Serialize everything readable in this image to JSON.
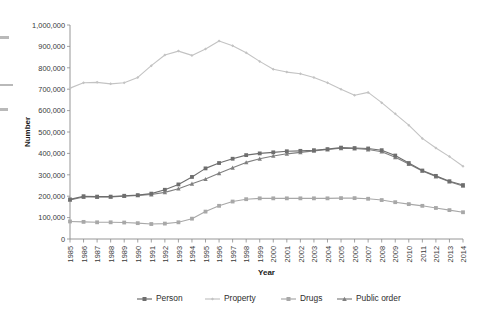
{
  "chart_data": {
    "type": "line",
    "title": "",
    "xlabel": "Year",
    "ylabel": "Number",
    "ylim": [
      0,
      1000000
    ],
    "ytick_labels": [
      "0",
      "100,000",
      "200,000",
      "300,000",
      "400,000",
      "500,000",
      "600,000",
      "700,000",
      "800,000",
      "900,000",
      "1,000,000"
    ],
    "ytick_values": [
      0,
      100000,
      200000,
      300000,
      400000,
      500000,
      600000,
      700000,
      800000,
      900000,
      1000000
    ],
    "grid": false,
    "legend_position": "bottom",
    "categories": [
      "1985",
      "1986",
      "1987",
      "1988",
      "1989",
      "1990",
      "1991",
      "1992",
      "1993",
      "1994",
      "1995",
      "1996",
      "1997",
      "1998",
      "1999",
      "2000",
      "2001",
      "2002",
      "2003",
      "2004",
      "2005",
      "2006",
      "2007",
      "2008",
      "2009",
      "2010",
      "2011",
      "2012",
      "2013",
      "2014"
    ],
    "series": [
      {
        "name": "Person",
        "color": "#6e6e6e",
        "marker": "square",
        "values": [
          185000,
          200000,
          198000,
          198000,
          202000,
          205000,
          212000,
          230000,
          255000,
          290000,
          330000,
          355000,
          375000,
          392000,
          400000,
          405000,
          410000,
          412000,
          415000,
          420000,
          427000,
          425000,
          423000,
          415000,
          390000,
          355000,
          320000,
          295000,
          270000,
          252000
        ]
      },
      {
        "name": "Property",
        "color": "#c3c3c3",
        "marker": "diamond",
        "values": [
          705000,
          730000,
          732000,
          725000,
          730000,
          755000,
          810000,
          860000,
          878000,
          858000,
          888000,
          925000,
          903000,
          870000,
          830000,
          793000,
          780000,
          772000,
          755000,
          730000,
          700000,
          672000,
          685000,
          637000,
          585000,
          532000,
          470000,
          425000,
          385000,
          340000
        ]
      },
      {
        "name": "Drugs",
        "color": "#a8a8a8",
        "marker": "square",
        "values": [
          82000,
          80000,
          78000,
          78000,
          77000,
          74000,
          70000,
          72000,
          78000,
          95000,
          128000,
          155000,
          175000,
          186000,
          190000,
          190000,
          190000,
          190000,
          190000,
          190000,
          191000,
          191000,
          188000,
          182000,
          172000,
          163000,
          155000,
          145000,
          135000,
          125000
        ]
      },
      {
        "name": "Public order",
        "color": "#808080",
        "marker": "triangle",
        "values": [
          183000,
          196000,
          196000,
          197000,
          200000,
          204000,
          208000,
          218000,
          235000,
          258000,
          280000,
          307000,
          333000,
          358000,
          375000,
          388000,
          398000,
          405000,
          412000,
          418000,
          424000,
          423000,
          418000,
          408000,
          382000,
          350000,
          318000,
          292000,
          268000,
          248000
        ]
      }
    ]
  },
  "legend": {
    "items": [
      {
        "label": "Person"
      },
      {
        "label": "Property"
      },
      {
        "label": "Drugs"
      },
      {
        "label": "Public order"
      }
    ]
  }
}
